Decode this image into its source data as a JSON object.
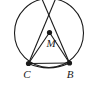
{
  "figure": {
    "type": "circle-geometry-diagram",
    "background_color": "#ffffff",
    "stroke_color": "#1a1a1a",
    "label_color": "#1a1a1a",
    "circle": {
      "name": "main-circle",
      "center_x": 49,
      "center_y": 33,
      "radius": 34.5,
      "stroke_width": 1.1
    },
    "center_point": {
      "name": "M",
      "label": "M",
      "x": 49.5,
      "y": 32.5,
      "dot_radius": 2.6,
      "label_x": 51,
      "label_y": 47,
      "font_size": 11
    },
    "points": [
      {
        "name": "C",
        "label": "C",
        "x": 28.5,
        "y": 63.5,
        "dot_radius": 2.6,
        "label_x": 27,
        "label_y": 78,
        "font_size": 11
      },
      {
        "name": "B",
        "label": "B",
        "x": 69.5,
        "y": 63.0,
        "dot_radius": 2.6,
        "label_x": 70,
        "label_y": 78,
        "font_size": 11
      }
    ],
    "segments": [
      {
        "name": "segment-M-C",
        "x1": 49.5,
        "y1": 32.5,
        "x2": 28.5,
        "y2": 63.5
      },
      {
        "name": "segment-M-B",
        "x1": 49.5,
        "y1": 32.5,
        "x2": 69.5,
        "y2": 63.0
      },
      {
        "name": "chord-C-B",
        "x1": 28.5,
        "y1": 63.5,
        "x2": 69.5,
        "y2": 63.0
      },
      {
        "name": "chord-C-upper-right",
        "x1": 28.5,
        "y1": 63.5,
        "x2": 55.5,
        "y2": -1
      },
      {
        "name": "chord-B-upper-left",
        "x1": 69.5,
        "y1": 63.0,
        "x2": 42.0,
        "y2": -1
      }
    ],
    "chord_arc": {
      "name": "arc-C-to-B",
      "path": "M 28.5 63.5 Q 49 72.5 69.5 63.0"
    },
    "stroke_width": 1.1
  }
}
